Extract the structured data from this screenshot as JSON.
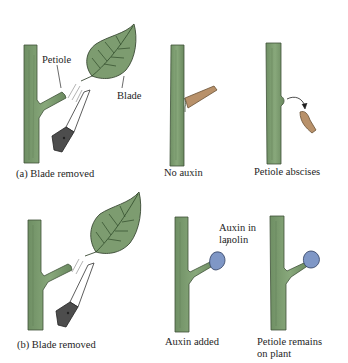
{
  "figure": {
    "colors": {
      "stem": "#7e9e72",
      "stem_dark": "#5f7d56",
      "leaf": "#7a9a6e",
      "vein": "#2f4a2a",
      "outline": "#3a4a34",
      "petiole_cut": "#b8916a",
      "lanolin": "#7f97c6",
      "knife_blade": "#ffffff",
      "knife_handle": "#4a4a4a"
    },
    "panel_a": {
      "caption": "(a) Blade removed",
      "labels": {
        "petiole": "Petiole",
        "blade": "Blade"
      },
      "steps": [
        {
          "caption": "No auxin"
        },
        {
          "caption": "Petiole abscises"
        }
      ]
    },
    "panel_b": {
      "caption": "(b) Blade removed",
      "steps": [
        {
          "caption": "Auxin added",
          "label_line1": "Auxin in",
          "label_line2": "lanolin"
        },
        {
          "caption_line1": "Petiole remains",
          "caption_line2": "on plant"
        }
      ]
    }
  }
}
